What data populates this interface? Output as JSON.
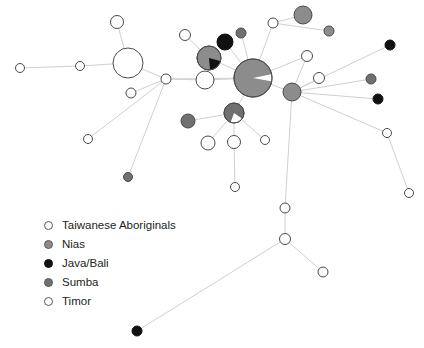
{
  "figure": {
    "type": "haplotype-network",
    "background": "#ffffff",
    "edge_color": "#d0d0d0",
    "node_stroke": "#4a4a4a"
  },
  "legend": {
    "position": "bottom-left",
    "items": [
      {
        "label": "Taiwanese Aboriginals",
        "color": "#fbfbfb",
        "marker": "open-circle-icon"
      },
      {
        "label": "Nias",
        "color": "#8c8c8c",
        "marker": "filled-circle-icon"
      },
      {
        "label": "Java/Bali",
        "color": "#111111",
        "marker": "filled-circle-icon"
      },
      {
        "label": "Sumba",
        "color": "#707070",
        "marker": "filled-circle-icon"
      },
      {
        "label": "Timor",
        "color": "#ffffff",
        "marker": "open-circle-icon"
      }
    ]
  },
  "chart_data": {
    "type": "scatter",
    "title": "",
    "xlabel": "",
    "ylabel": "",
    "grid": false,
    "legend_position": "bottom-left",
    "nodes": [
      {
        "id": "n1",
        "x": 20,
        "y": 68,
        "r": 4.5,
        "fill": "#ffffff",
        "group": "Timor"
      },
      {
        "id": "n2",
        "x": 80,
        "y": 66,
        "r": 4.5,
        "fill": "#ffffff",
        "group": "Timor"
      },
      {
        "id": "n3",
        "x": 128,
        "y": 63,
        "r": 15,
        "fill": "#ffffff",
        "group": "Timor"
      },
      {
        "id": "n4",
        "x": 117,
        "y": 22,
        "r": 6.5,
        "fill": "#ffffff",
        "group": "Timor"
      },
      {
        "id": "n5",
        "x": 131,
        "y": 93,
        "r": 5,
        "fill": "#ffffff",
        "group": "Timor"
      },
      {
        "id": "n6",
        "x": 166,
        "y": 79,
        "r": 5,
        "fill": "#ffffff",
        "group": "Timor"
      },
      {
        "id": "n7",
        "x": 185,
        "y": 35,
        "r": 5.5,
        "fill": "#ffffff",
        "group": "Timor"
      },
      {
        "id": "n8",
        "x": 205,
        "y": 80,
        "r": 9,
        "fill": "#ffffff",
        "group": "Timor"
      },
      {
        "id": "n9",
        "x": 209,
        "y": 58,
        "r": 12,
        "fill": "#8c8c8c",
        "group": "Nias",
        "wedge": {
          "color": "#111111",
          "start": 15,
          "extent": 70
        }
      },
      {
        "id": "n10",
        "x": 225,
        "y": 42,
        "r": 8,
        "fill": "#111111",
        "group": "Java/Bali"
      },
      {
        "id": "n11",
        "x": 241,
        "y": 33,
        "r": 5,
        "fill": "#707070",
        "group": "Sumba"
      },
      {
        "id": "n12",
        "x": 253,
        "y": 78,
        "r": 19,
        "fill": "#8c8c8c",
        "group": "Nias",
        "wedge": {
          "color": "#ffffff",
          "start": -12,
          "extent": 22
        }
      },
      {
        "id": "n13",
        "x": 188,
        "y": 121,
        "r": 7,
        "fill": "#707070",
        "group": "Sumba"
      },
      {
        "id": "n14",
        "x": 234,
        "y": 113,
        "r": 10,
        "fill": "#707070",
        "group": "Sumba",
        "wedge": {
          "color": "#ffffff",
          "start": 35,
          "extent": 75
        }
      },
      {
        "id": "n15",
        "x": 208,
        "y": 143,
        "r": 7,
        "fill": "#ffffff",
        "group": "Timor"
      },
      {
        "id": "n16",
        "x": 234,
        "y": 142,
        "r": 6.5,
        "fill": "#ffffff",
        "group": "Timor"
      },
      {
        "id": "n17",
        "x": 265,
        "y": 140,
        "r": 4.5,
        "fill": "#ffffff",
        "group": "Timor"
      },
      {
        "id": "n18",
        "x": 235,
        "y": 187,
        "r": 4.5,
        "fill": "#ffffff",
        "group": "Timor"
      },
      {
        "id": "n19",
        "x": 128,
        "y": 177,
        "r": 4.5,
        "fill": "#707070",
        "group": "Sumba"
      },
      {
        "id": "n20",
        "x": 88,
        "y": 139,
        "r": 4.5,
        "fill": "#ffffff",
        "group": "Timor"
      },
      {
        "id": "n21",
        "x": 292,
        "y": 92,
        "r": 9,
        "fill": "#8c8c8c",
        "group": "Nias"
      },
      {
        "id": "n22",
        "x": 273,
        "y": 23,
        "r": 5,
        "fill": "#ffffff",
        "group": "Timor"
      },
      {
        "id": "n23",
        "x": 303,
        "y": 15,
        "r": 9,
        "fill": "#8c8c8c",
        "group": "Nias"
      },
      {
        "id": "n24",
        "x": 329,
        "y": 31,
        "r": 5,
        "fill": "#8c8c8c",
        "group": "Nias"
      },
      {
        "id": "n25",
        "x": 307,
        "y": 56,
        "r": 5.5,
        "fill": "#ffffff",
        "group": "Timor"
      },
      {
        "id": "n26",
        "x": 319,
        "y": 78,
        "r": 5.5,
        "fill": "#ffffff",
        "group": "Timor"
      },
      {
        "id": "n27",
        "x": 390,
        "y": 45,
        "r": 5,
        "fill": "#111111",
        "group": "Java/Bali"
      },
      {
        "id": "n28",
        "x": 371,
        "y": 79,
        "r": 5,
        "fill": "#707070",
        "group": "Sumba"
      },
      {
        "id": "n29",
        "x": 378,
        "y": 99,
        "r": 5,
        "fill": "#111111",
        "group": "Java/Bali"
      },
      {
        "id": "n30",
        "x": 387,
        "y": 133,
        "r": 4.5,
        "fill": "#ffffff",
        "group": "Timor"
      },
      {
        "id": "n31",
        "x": 409,
        "y": 193,
        "r": 4.5,
        "fill": "#ffffff",
        "group": "Timor"
      },
      {
        "id": "n32",
        "x": 285,
        "y": 208,
        "r": 5,
        "fill": "#ffffff",
        "group": "Timor"
      },
      {
        "id": "n33",
        "x": 285,
        "y": 239,
        "r": 5.5,
        "fill": "#ffffff",
        "group": "Timor"
      },
      {
        "id": "n34",
        "x": 323,
        "y": 272,
        "r": 5,
        "fill": "#ffffff",
        "group": "Timor"
      },
      {
        "id": "n35",
        "x": 137,
        "y": 331,
        "r": 5,
        "fill": "#111111",
        "group": "Java/Bali"
      }
    ],
    "edges": [
      [
        "n1",
        "n2"
      ],
      [
        "n2",
        "n3"
      ],
      [
        "n3",
        "n4"
      ],
      [
        "n3",
        "n6"
      ],
      [
        "n5",
        "n6"
      ],
      [
        "n6",
        "n8"
      ],
      [
        "n6",
        "n12"
      ],
      [
        "n7",
        "n9"
      ],
      [
        "n8",
        "n12"
      ],
      [
        "n9",
        "n12"
      ],
      [
        "n10",
        "n12"
      ],
      [
        "n11",
        "n12"
      ],
      [
        "n12",
        "n14"
      ],
      [
        "n12",
        "n21"
      ],
      [
        "n12",
        "n25"
      ],
      [
        "n12",
        "n22"
      ],
      [
        "n13",
        "n14"
      ],
      [
        "n14",
        "n15"
      ],
      [
        "n14",
        "n16"
      ],
      [
        "n14",
        "n17"
      ],
      [
        "n16",
        "n18"
      ],
      [
        "n6",
        "n19"
      ],
      [
        "n6",
        "n20"
      ],
      [
        "n21",
        "n25"
      ],
      [
        "n21",
        "n26"
      ],
      [
        "n22",
        "n23"
      ],
      [
        "n22",
        "n24"
      ],
      [
        "n21",
        "n27"
      ],
      [
        "n21",
        "n28"
      ],
      [
        "n21",
        "n29"
      ],
      [
        "n21",
        "n30"
      ],
      [
        "n30",
        "n31"
      ],
      [
        "n21",
        "n32"
      ],
      [
        "n32",
        "n33"
      ],
      [
        "n33",
        "n34"
      ],
      [
        "n33",
        "n35"
      ]
    ]
  }
}
